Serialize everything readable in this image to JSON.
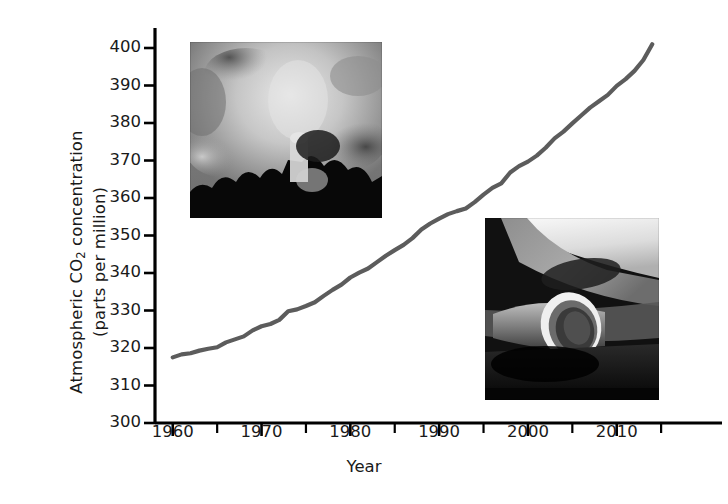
{
  "chart_data": {
    "type": "line",
    "title": "",
    "xlabel": "Year",
    "ylabel": "Atmospheric CO2 concentration (parts per million)",
    "ylabel_line1": "Atmospheric CO",
    "ylabel_sub": "2",
    "ylabel_line1_tail": " concentration",
    "ylabel_line2": "(parts per million)",
    "xlim": [
      1958,
      2016
    ],
    "ylim": [
      300,
      400
    ],
    "grid": false,
    "legend": "none",
    "series_color": "#5c5c5c",
    "axis_color": "#000000",
    "yticks": [
      300,
      310,
      320,
      330,
      340,
      350,
      360,
      370,
      380,
      390,
      400
    ],
    "ytick_labels": [
      "300",
      "310",
      "320",
      "330",
      "340",
      "350",
      "360",
      "370",
      "380",
      "390",
      "400"
    ],
    "xticks_major": [
      1960,
      1970,
      1980,
      1990,
      2000,
      2010
    ],
    "xtick_labels": [
      "1960",
      "1970",
      "1980",
      "1990",
      "2000",
      "2010"
    ],
    "xticks_minor": [
      1965,
      1975,
      1985,
      1995,
      2005,
      2015
    ],
    "x": [
      1960,
      1961,
      1962,
      1963,
      1964,
      1965,
      1966,
      1967,
      1968,
      1969,
      1970,
      1971,
      1972,
      1973,
      1974,
      1975,
      1976,
      1977,
      1978,
      1979,
      1980,
      1981,
      1982,
      1983,
      1984,
      1985,
      1986,
      1987,
      1988,
      1989,
      1990,
      1991,
      1992,
      1993,
      1994,
      1995,
      1996,
      1997,
      1998,
      1999,
      2000,
      2001,
      2002,
      2003,
      2004,
      2005,
      2006,
      2007,
      2008,
      2009,
      2010,
      2011,
      2012,
      2013,
      2014
    ],
    "values": [
      317.5,
      318.3,
      318.6,
      319.3,
      319.8,
      320.2,
      321.5,
      322.3,
      323.1,
      324.7,
      325.8,
      326.4,
      327.5,
      329.8,
      330.3,
      331.2,
      332.2,
      333.9,
      335.5,
      336.9,
      338.8,
      340.1,
      341.2,
      342.9,
      344.6,
      346.1,
      347.5,
      349.3,
      351.6,
      353.2,
      354.5,
      355.7,
      356.5,
      357.2,
      358.9,
      360.9,
      362.7,
      363.9,
      366.8,
      368.5,
      369.7,
      371.3,
      373.4,
      375.9,
      377.7,
      379.9,
      382.0,
      384.1,
      385.8,
      387.5,
      389.9,
      391.7,
      393.9,
      396.8,
      401.0
    ],
    "annotations": [
      {
        "name": "smokestack-photo",
        "description": "Black and white photograph of industrial smokestacks emitting smoke"
      },
      {
        "name": "car-exhaust-photo",
        "description": "Black and white photograph of a car exhaust tailpipe"
      }
    ]
  },
  "figure": {
    "background_color": "#ffffff"
  }
}
